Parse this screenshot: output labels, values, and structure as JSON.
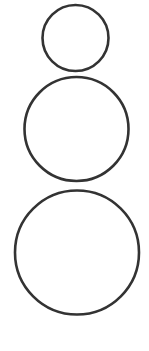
{
  "diagram": {
    "background": "#ffffff",
    "stroke_color": "#333333",
    "stroke_width": 2.6,
    "shapes": [
      {
        "id": "circle-top",
        "type": "circle",
        "cx": 75.5,
        "cy": 38,
        "r": 33
      },
      {
        "id": "circle-middle",
        "type": "circle",
        "cx": 76.5,
        "cy": 129,
        "r": 52
      },
      {
        "id": "circle-bottom",
        "type": "circle",
        "cx": 77,
        "cy": 252.5,
        "r": 62
      }
    ]
  }
}
